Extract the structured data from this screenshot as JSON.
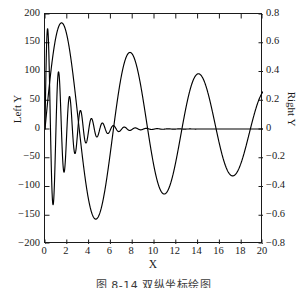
{
  "caption": "图 8-14  双纵坐标绘图",
  "chart_data": {
    "type": "line",
    "title": "",
    "xlabel": "X",
    "ylabel_left": "Left Y",
    "ylabel_right": "Right Y",
    "xlim": [
      0,
      20
    ],
    "ylim_left": [
      -200,
      200
    ],
    "ylim_right": [
      -0.8,
      0.8
    ],
    "grid": false,
    "legend": "none",
    "line_color": "#000000",
    "xticks": [
      0,
      2,
      4,
      6,
      8,
      10,
      12,
      14,
      16,
      18,
      20
    ],
    "xticklabels": [
      "0",
      "2",
      "4",
      "6",
      "8",
      "10",
      "12",
      "14",
      "16",
      "18",
      "20"
    ],
    "yticks_left": [
      -200,
      -150,
      -100,
      -50,
      0,
      50,
      100,
      150,
      200
    ],
    "yticklabels_left": [
      "−200",
      "−150",
      "−100",
      "−50",
      "0",
      "50",
      "100",
      "150",
      "200"
    ],
    "yticks_right": [
      -0.8,
      -0.6,
      -0.4,
      -0.2,
      0,
      0.2,
      0.4,
      0.6,
      0.8
    ],
    "yticklabels_right": [
      "−0.8",
      "−0.6",
      "−0.4",
      "−0.2",
      "0",
      "0.2",
      "0.4",
      "0.6",
      "0.8"
    ],
    "series": [
      {
        "name": "damped-oscillation",
        "axis": "left",
        "description": "High-frequency damped sinusoid, amplitude ~190 decaying toward 0",
        "amplitude": 200,
        "decay": 0.55,
        "frequency": 6.2,
        "phase": 0.0,
        "key_points": [
          {
            "x": 0.0,
            "y": 0
          },
          {
            "x": 0.12,
            "y": 185
          },
          {
            "x": 0.4,
            "y": -160
          },
          {
            "x": 0.75,
            "y": 130
          },
          {
            "x": 1.05,
            "y": -118
          },
          {
            "x": 1.4,
            "y": 100
          },
          {
            "x": 1.75,
            "y": -88
          },
          {
            "x": 2.1,
            "y": 72
          },
          {
            "x": 2.45,
            "y": -60
          },
          {
            "x": 2.8,
            "y": 50
          },
          {
            "x": 3.2,
            "y": -42
          },
          {
            "x": 3.6,
            "y": 34
          },
          {
            "x": 4.0,
            "y": -27
          },
          {
            "x": 4.5,
            "y": 22
          },
          {
            "x": 5.0,
            "y": -17
          },
          {
            "x": 5.5,
            "y": 13
          },
          {
            "x": 6.0,
            "y": -10
          },
          {
            "x": 7.0,
            "y": 6
          },
          {
            "x": 8.0,
            "y": -4
          },
          {
            "x": 10.0,
            "y": 2
          },
          {
            "x": 14.0,
            "y": 1
          },
          {
            "x": 20.0,
            "y": 0
          }
        ]
      },
      {
        "name": "slow-sine",
        "axis": "right",
        "description": "Slow large-amplitude damped sine, period ~6.3",
        "key_points": [
          {
            "x": 0.0,
            "y": 0.0
          },
          {
            "x": 1.55,
            "y": 0.745
          },
          {
            "x": 3.15,
            "y": 0.0
          },
          {
            "x": 4.62,
            "y": -0.632
          },
          {
            "x": 6.25,
            "y": 0.0
          },
          {
            "x": 7.8,
            "y": 0.54
          },
          {
            "x": 9.4,
            "y": 0.0
          },
          {
            "x": 10.9,
            "y": -0.455
          },
          {
            "x": 12.55,
            "y": 0.0
          },
          {
            "x": 14.05,
            "y": 0.392
          },
          {
            "x": 15.7,
            "y": 0.0
          },
          {
            "x": 17.2,
            "y": -0.338
          },
          {
            "x": 18.85,
            "y": 0.0
          },
          {
            "x": 20.0,
            "y": 0.262
          }
        ]
      }
    ]
  }
}
